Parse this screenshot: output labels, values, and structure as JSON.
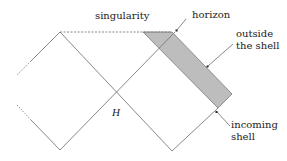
{
  "diagram": {
    "type": "penrose-diagram",
    "labels": {
      "singularity": "singularity",
      "horizon": "horizon",
      "outside_line1": "outside",
      "outside_line2": "the shell",
      "incoming_line1": "incoming",
      "incoming_line2": "shell",
      "H": "H"
    },
    "colors": {
      "line": "#7a7a7a",
      "shell_fill": "#bdbdbd",
      "text": "#222222"
    }
  }
}
